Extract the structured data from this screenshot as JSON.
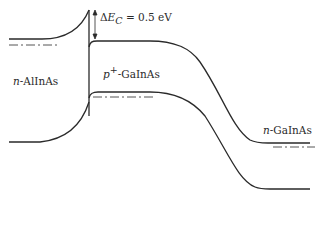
{
  "diagram": {
    "type": "energy-band-diagram",
    "regions": [
      {
        "id": "emitter",
        "label_prefix": "n",
        "label_rest": "-AlInAs"
      },
      {
        "id": "base",
        "label_prefix": "p",
        "label_sup": "+",
        "label_rest": "-GaInAs"
      },
      {
        "id": "collector",
        "label_prefix": "n",
        "label_rest": "-GaInAs"
      }
    ],
    "annotation": {
      "delta": "Δ",
      "symbol": "E",
      "subscript": "C",
      "rest": " = 0.5 eV"
    },
    "line_color": "#2a2a2a"
  }
}
